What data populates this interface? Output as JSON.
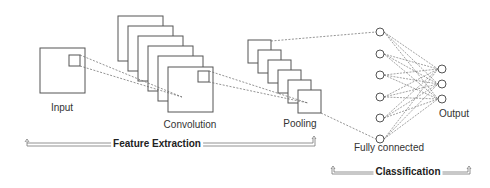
{
  "diagram": {
    "labels": {
      "input": "Input",
      "convolution": "Convolution",
      "pooling": "Pooling",
      "fully_connected": "Fully connected",
      "output": "Output"
    },
    "sections": {
      "feature_extraction": "Feature Extraction",
      "classification": "Classification"
    },
    "stages": [
      {
        "name": "Input",
        "maps": 1
      },
      {
        "name": "Convolution",
        "maps": 6
      },
      {
        "name": "Pooling",
        "maps": 6
      },
      {
        "name": "Fully connected",
        "neurons": 6
      },
      {
        "name": "Output",
        "neurons": 3
      }
    ],
    "colors": {
      "stroke": "#444444",
      "dashed": "#666666",
      "text": "#333333"
    }
  }
}
